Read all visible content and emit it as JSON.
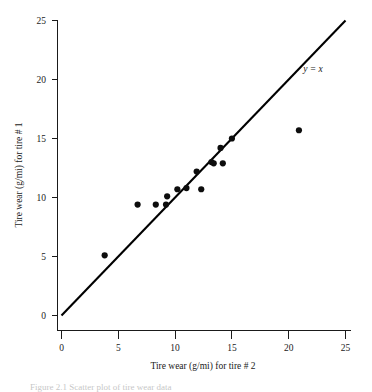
{
  "chart_data": {
    "type": "scatter",
    "title": "",
    "xlabel": "Tire wear (g/mi) for tire # 2",
    "ylabel": "Tire wear (g/mi) for tire # 1",
    "xlim": [
      0,
      25
    ],
    "ylim": [
      0,
      25
    ],
    "xticks": [
      0,
      5,
      10,
      15,
      20,
      25
    ],
    "yticks": [
      0,
      5,
      10,
      15,
      20,
      25
    ],
    "xtick_labels": [
      "0",
      "5",
      "10",
      "15",
      "20",
      "25"
    ],
    "ytick_labels": [
      "0",
      "5",
      "10",
      "15",
      "20",
      "25"
    ],
    "grid": false,
    "legend": "none",
    "point_color": "#0d0d0d",
    "line_color": "#000000",
    "annotations": [
      {
        "text": "y = x",
        "x": 22.2,
        "y": 21.6,
        "style": "italic-serif"
      }
    ],
    "reference_line": {
      "label": "y = x",
      "slope": 1,
      "intercept": 0,
      "x_start": 0,
      "x_end": 25,
      "y_start": 0,
      "y_end": 25
    },
    "series": [
      {
        "name": "Tire wear pairs",
        "marker": "filled-circle",
        "points": [
          {
            "x": 3.8,
            "y": 5.1
          },
          {
            "x": 6.7,
            "y": 9.4
          },
          {
            "x": 8.3,
            "y": 9.4
          },
          {
            "x": 9.2,
            "y": 9.4
          },
          {
            "x": 9.3,
            "y": 10.1
          },
          {
            "x": 10.2,
            "y": 10.7
          },
          {
            "x": 11.0,
            "y": 10.8
          },
          {
            "x": 11.9,
            "y": 12.2
          },
          {
            "x": 12.3,
            "y": 10.7
          },
          {
            "x": 13.2,
            "y": 13.0
          },
          {
            "x": 13.4,
            "y": 12.9
          },
          {
            "x": 14.0,
            "y": 14.2
          },
          {
            "x": 14.2,
            "y": 12.9
          },
          {
            "x": 15.0,
            "y": 15.0
          },
          {
            "x": 20.9,
            "y": 15.7
          }
        ]
      }
    ]
  },
  "caption": {
    "text": "Figure 2.1   Scatter plot of tire wear data"
  }
}
